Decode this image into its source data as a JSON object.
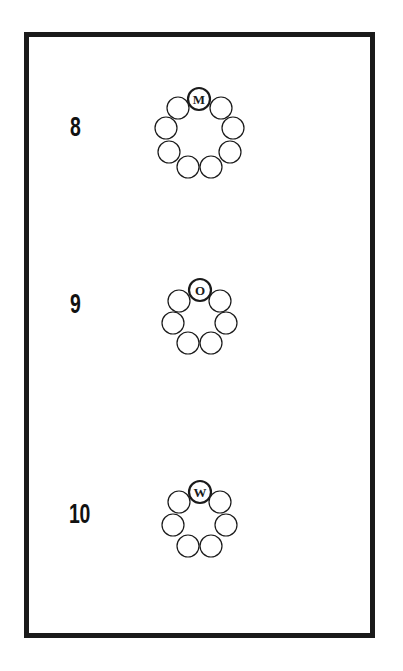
{
  "puzzles": [
    {
      "number": "8",
      "letter": "M",
      "circle_count": 9,
      "label_pos": {
        "x": 70,
        "y": 114
      },
      "circles": [
        {
          "cx": 199,
          "cy": 99,
          "letter": "M"
        },
        {
          "cx": 221,
          "cy": 108
        },
        {
          "cx": 233,
          "cy": 128
        },
        {
          "cx": 230,
          "cy": 152
        },
        {
          "cx": 211,
          "cy": 167
        },
        {
          "cx": 188,
          "cy": 167
        },
        {
          "cx": 169,
          "cy": 152
        },
        {
          "cx": 166,
          "cy": 128
        },
        {
          "cx": 178,
          "cy": 108
        }
      ]
    },
    {
      "number": "9",
      "letter": "O",
      "circle_count": 7,
      "label_pos": {
        "x": 70,
        "y": 291
      },
      "circles": [
        {
          "cx": 200,
          "cy": 290,
          "letter": "O"
        },
        {
          "cx": 220,
          "cy": 301
        },
        {
          "cx": 226,
          "cy": 323
        },
        {
          "cx": 211,
          "cy": 343
        },
        {
          "cx": 188,
          "cy": 343
        },
        {
          "cx": 173,
          "cy": 323
        },
        {
          "cx": 179,
          "cy": 301
        }
      ]
    },
    {
      "number": "10",
      "letter": "W",
      "circle_count": 7,
      "label_pos": {
        "x": 69,
        "y": 501
      },
      "circles": [
        {
          "cx": 200,
          "cy": 492,
          "letter": "W"
        },
        {
          "cx": 220,
          "cy": 502
        },
        {
          "cx": 226,
          "cy": 525
        },
        {
          "cx": 211,
          "cy": 546
        },
        {
          "cx": 188,
          "cy": 546
        },
        {
          "cx": 173,
          "cy": 525
        },
        {
          "cx": 179,
          "cy": 502
        }
      ]
    }
  ],
  "colors": {
    "ink": "#1a1a1a",
    "paper": "#ffffff"
  }
}
